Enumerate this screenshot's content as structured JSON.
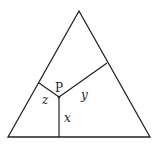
{
  "diagram": {
    "point_label": "P",
    "labels": {
      "x": "x",
      "y": "y",
      "z": "z"
    },
    "colors": {
      "stroke": "#222222",
      "background": "#ffffff"
    }
  }
}
